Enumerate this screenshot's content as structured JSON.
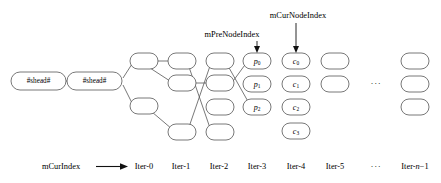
{
  "diagram": {
    "colors": {
      "node_stroke": "#555555",
      "node_fill": "#ffffff",
      "edge": "#555555",
      "pointer": "#111111",
      "background": "#ffffff",
      "text": "#000000"
    },
    "head_nodes": [
      {
        "id": "head-0",
        "label": "#shead#",
        "x": 38,
        "y": 81
      },
      {
        "id": "head-1",
        "label": "#shead#",
        "x": 95,
        "y": 81
      }
    ],
    "columns": [
      {
        "id": "iter-0",
        "axis_label": "Iter-0",
        "axis_x": 144,
        "nodes": [
          {
            "id": "n0-r1",
            "label": "",
            "x": 144,
            "y": 61
          },
          {
            "id": "n0-r3",
            "label": "",
            "x": 144,
            "y": 106
          }
        ]
      },
      {
        "id": "iter-1",
        "axis_label": "Iter-1",
        "axis_x": 181,
        "nodes": [
          {
            "id": "n1-r1",
            "label": "",
            "x": 181,
            "y": 61
          },
          {
            "id": "n1-r2",
            "label": "",
            "x": 181,
            "y": 83
          },
          {
            "id": "n1-r4",
            "label": "",
            "x": 181,
            "y": 132
          }
        ]
      },
      {
        "id": "iter-2",
        "axis_label": "Iter-2",
        "axis_x": 219,
        "nodes": [
          {
            "id": "n2-r1",
            "label": "",
            "x": 219,
            "y": 61
          },
          {
            "id": "n2-r2",
            "label": "",
            "x": 219,
            "y": 83
          },
          {
            "id": "n2-r3",
            "label": "",
            "x": 219,
            "y": 107
          },
          {
            "id": "n2-r4",
            "label": "",
            "x": 219,
            "y": 132
          }
        ]
      },
      {
        "id": "iter-3",
        "axis_label": "Iter-3",
        "axis_x": 257,
        "nodes": [
          {
            "id": "n3-r1",
            "label": "p",
            "sub": "0",
            "x": 257,
            "y": 61
          },
          {
            "id": "n3-r2",
            "label": "p",
            "sub": "1",
            "x": 257,
            "y": 84
          },
          {
            "id": "n3-r3",
            "label": "p",
            "sub": "2",
            "x": 257,
            "y": 107
          }
        ]
      },
      {
        "id": "iter-4",
        "axis_label": "Iter-4",
        "axis_x": 296,
        "nodes": [
          {
            "id": "n4-r1",
            "label": "c",
            "sub": "0",
            "x": 296,
            "y": 61
          },
          {
            "id": "n4-r2",
            "label": "c",
            "sub": "1",
            "x": 296,
            "y": 84
          },
          {
            "id": "n4-r3",
            "label": "c",
            "sub": "2",
            "x": 296,
            "y": 107
          },
          {
            "id": "n4-r4",
            "label": "c",
            "sub": "3",
            "x": 296,
            "y": 131
          }
        ]
      },
      {
        "id": "iter-5",
        "axis_label": "Iter-5",
        "axis_x": 335,
        "nodes": [
          {
            "id": "n5-r1",
            "label": "",
            "x": 335,
            "y": 61
          },
          {
            "id": "n5-r2",
            "label": "",
            "x": 335,
            "y": 84
          }
        ]
      },
      {
        "id": "iter-n-1",
        "axis_label": "Iter-n−1",
        "axis_label_prefix": "Iter-",
        "axis_label_italic": "n",
        "axis_label_suffix": "−1",
        "axis_x": 415,
        "nodes": [
          {
            "id": "nn-r1",
            "label": "",
            "x": 415,
            "y": 61
          },
          {
            "id": "nn-r2",
            "label": "",
            "x": 415,
            "y": 84
          },
          {
            "id": "nn-r3",
            "label": "",
            "x": 415,
            "y": 107
          }
        ]
      }
    ],
    "grid_ellipsis": {
      "text": "···",
      "x": 376,
      "y": 84
    },
    "axis_ellipsis": {
      "text": "···",
      "x": 376,
      "y": 167
    },
    "pointers": [
      {
        "id": "pre-node-index",
        "label": "mPreNodeIndex",
        "label_x": 232,
        "label_y": 35,
        "arrow_x": 257,
        "arrow_top": 41,
        "arrow_bottom": 52,
        "target": "n3-r1"
      },
      {
        "id": "cur-node-index",
        "label": "mCurNodeIndex",
        "label_x": 298,
        "label_y": 16,
        "arrow_x": 296,
        "arrow_top": 23,
        "arrow_bottom": 52,
        "target": "n4-r1"
      }
    ],
    "axis": {
      "index_label": "mCurIndex",
      "index_label_x": 61,
      "index_label_y": 167,
      "arrow_from_x": 96,
      "arrow_to_x": 127,
      "arrow_y": 167
    },
    "edges": [
      {
        "from": "head-0",
        "to": "head-1",
        "type": "horizontal"
      },
      {
        "from": "head-1",
        "to": "n0-r1",
        "type": "diagonal-up"
      },
      {
        "from": "head-1",
        "to": "n0-r3",
        "type": "diagonal-down"
      },
      {
        "from": "n0-r1",
        "to": "n1-r1",
        "type": "horizontal"
      },
      {
        "from": "n0-r1",
        "to": "n1-r2",
        "type": "diagonal-down"
      },
      {
        "from": "n0-r3",
        "to": "n1-r4",
        "type": "diagonal-down"
      },
      {
        "from": "n1-r2",
        "to": "n2-r2",
        "type": "horizontal"
      },
      {
        "from": "n1-r1",
        "to": "n2-r4",
        "type": "diagonal-down"
      },
      {
        "from": "n1-r4",
        "to": "n2-r1",
        "type": "diagonal-up"
      },
      {
        "from": "n2-r2",
        "to": "n3-r1",
        "type": "diagonal-up"
      },
      {
        "from": "n2-r1",
        "to": "n3-r3",
        "type": "diagonal-down"
      }
    ]
  }
}
